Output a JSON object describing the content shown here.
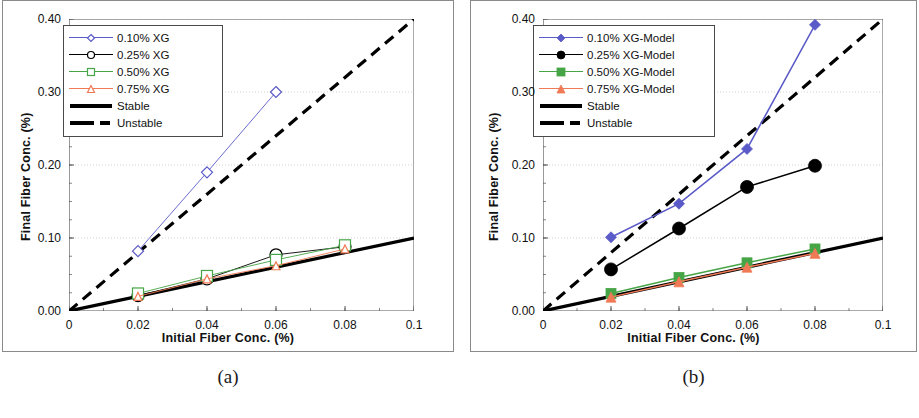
{
  "figure": {
    "panels": [
      {
        "id": "a",
        "caption": "(a)",
        "xlabel": "Initial Fiber Conc. (%)",
        "ylabel": "Final Fiber Conc. (%)"
      },
      {
        "id": "b",
        "caption": "(b)",
        "xlabel": "Initial Fiber Conc. (%)",
        "ylabel": "Final Fiber Conc. (%)"
      }
    ]
  },
  "colors": {
    "series_010": "#5a5ac8",
    "series_025": "#000000",
    "series_050": "#46a546",
    "series_075": "#f07a55",
    "stable": "#000000",
    "unstable": "#000000",
    "axis": "#555555",
    "grid": "#c8c8c8",
    "frame": "#8a8a8a"
  },
  "chart_data": [
    {
      "type": "line",
      "panel": "a",
      "title": "",
      "xlabel": "Initial Fiber Conc. (%)",
      "ylabel": "Final Fiber Conc. (%)",
      "xlim": [
        0,
        0.1
      ],
      "ylim": [
        0,
        0.4
      ],
      "xticks": [
        0,
        0.02,
        0.04,
        0.06,
        0.08,
        0.1
      ],
      "xticklabels": [
        "0",
        "0.02",
        "0.04",
        "0.06",
        "0.08",
        "0.1"
      ],
      "yticks": [
        0,
        0.1,
        0.2,
        0.3,
        0.4
      ],
      "yticklabels": [
        "0.00",
        "0.10",
        "0.20",
        "0.30",
        "0.40"
      ],
      "grid": "horizontal-dotted",
      "legend_position": "top-left",
      "x": [
        0.02,
        0.04,
        0.06,
        0.08
      ],
      "series": [
        {
          "name": "0.10% XG",
          "marker": "diamond-open",
          "color": "#5a5ac8",
          "values": [
            0.082,
            0.19,
            0.3,
            null
          ]
        },
        {
          "name": "0.25% XG",
          "marker": "circle-open",
          "color": "#000000",
          "values": [
            0.021,
            0.044,
            0.077,
            0.088
          ]
        },
        {
          "name": "0.50% XG",
          "marker": "square-open",
          "color": "#46a546",
          "values": [
            0.024,
            0.048,
            0.07,
            0.09
          ]
        },
        {
          "name": "0.75% XG",
          "marker": "triangle-open",
          "color": "#f07a55",
          "values": [
            0.02,
            0.044,
            0.062,
            0.085
          ]
        }
      ],
      "reference_lines": [
        {
          "name": "Stable",
          "style": "solid",
          "color": "#000000",
          "from": [
            0,
            0
          ],
          "to": [
            0.1,
            0.1
          ]
        },
        {
          "name": "Unstable",
          "style": "dashed",
          "color": "#000000",
          "from": [
            0,
            0
          ],
          "to": [
            0.1,
            0.4
          ]
        }
      ],
      "legend": [
        "0.10% XG",
        "0.25% XG",
        "0.50% XG",
        "0.75% XG",
        "Stable",
        "Unstable"
      ]
    },
    {
      "type": "line",
      "panel": "b",
      "title": "",
      "xlabel": "Initial Fiber Conc. (%)",
      "ylabel": "Final Fiber Conc. (%)",
      "xlim": [
        0,
        0.1
      ],
      "ylim": [
        0,
        0.4
      ],
      "xticks": [
        0,
        0.02,
        0.04,
        0.06,
        0.08,
        0.1
      ],
      "xticklabels": [
        "0",
        "0.02",
        "0.04",
        "0.06",
        "0.08",
        "0.1"
      ],
      "yticks": [
        0,
        0.1,
        0.2,
        0.3,
        0.4
      ],
      "yticklabels": [
        "0.00",
        "0.10",
        "0.20",
        "0.30",
        "0.40"
      ],
      "grid": "horizontal-dotted",
      "legend_position": "top-left",
      "x": [
        0.02,
        0.04,
        0.06,
        0.08
      ],
      "series": [
        {
          "name": "0.10% XG-Model",
          "marker": "diamond-filled",
          "color": "#5a5ac8",
          "values": [
            0.101,
            0.147,
            0.222,
            0.392
          ]
        },
        {
          "name": "0.25% XG-Model",
          "marker": "circle-filled",
          "color": "#000000",
          "values": [
            0.057,
            0.113,
            0.17,
            0.199
          ]
        },
        {
          "name": "0.50% XG-Model",
          "marker": "square-filled",
          "color": "#46a546",
          "values": [
            0.024,
            0.046,
            0.066,
            0.085
          ]
        },
        {
          "name": "0.75% XG-Model",
          "marker": "triangle-filled",
          "color": "#f07a55",
          "values": [
            0.019,
            0.04,
            0.06,
            0.079
          ]
        }
      ],
      "reference_lines": [
        {
          "name": "Stable",
          "style": "solid",
          "color": "#000000",
          "from": [
            0,
            0
          ],
          "to": [
            0.1,
            0.1
          ]
        },
        {
          "name": "Unstable",
          "style": "dashed",
          "color": "#000000",
          "from": [
            0,
            0
          ],
          "to": [
            0.1,
            0.4
          ]
        }
      ],
      "legend": [
        "0.10% XG-Model",
        "0.25% XG-Model",
        "0.50% XG-Model",
        "0.75% XG-Model",
        "Stable",
        "Unstable"
      ]
    }
  ]
}
